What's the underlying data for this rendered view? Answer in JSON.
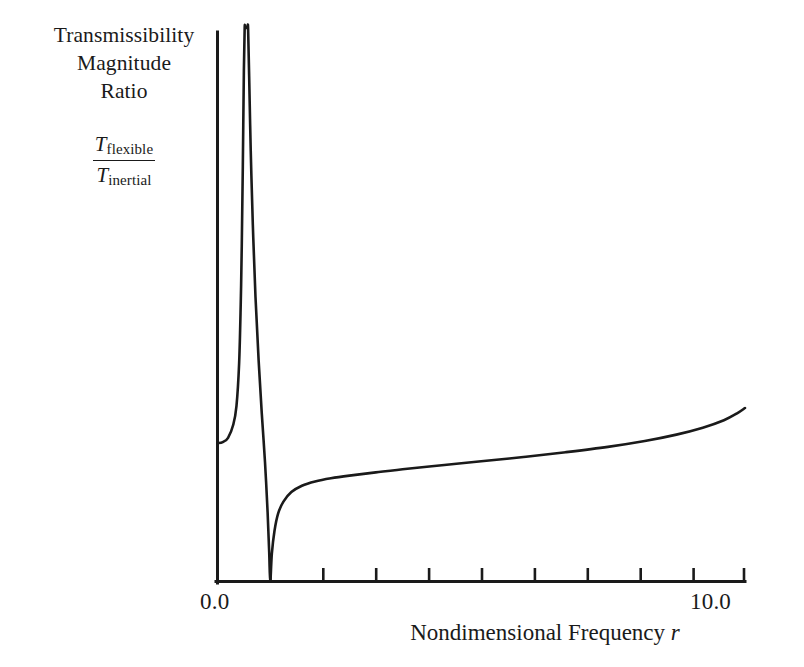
{
  "figure": {
    "background_color": "#ffffff",
    "ink_color": "#1a1a1a"
  },
  "y_axis_caption": {
    "line1": "Transmissibility",
    "line2": "Magnitude",
    "line3": "Ratio"
  },
  "ratio_fraction": {
    "numerator_symbol": "T",
    "numerator_subscript": "flexible",
    "denominator_symbol": "T",
    "denominator_subscript": "inertial"
  },
  "x_axis": {
    "title_text": "Nondimensional Frequency",
    "title_variable": "r",
    "min_label": "0.0",
    "max_label": "10.0"
  },
  "chart_data": {
    "type": "line",
    "title": "",
    "xlabel": "Nondimensional Frequency r",
    "ylabel": "Transmissibility Magnitude Ratio T_flexible / T_inertial",
    "xlim": [
      0.0,
      10.0
    ],
    "ylim": [
      0.0,
      10.4
    ],
    "grid": false,
    "legend": null,
    "xticks": [
      0.0,
      1.0,
      2.0,
      3.0,
      4.0,
      5.0,
      6.0,
      7.0,
      8.0,
      9.0,
      10.0
    ],
    "xticklabels": [
      "0.0",
      "",
      "",
      "",
      "",
      "",
      "",
      "",
      "",
      "",
      "10.0"
    ],
    "yticks": [],
    "yticklabels": [],
    "annotations": [
      {
        "label": "resonance asymptote (curve exits top of frame)",
        "x": 0.55
      },
      {
        "label": "anti-resonance null (curve touches zero)",
        "x": 1.0
      }
    ],
    "series": [
      {
        "name": "T_flexible / T_inertial",
        "color": "#1a1a1a",
        "x": [
          0.0,
          0.1,
          0.2,
          0.3,
          0.36,
          0.41,
          0.44,
          0.46,
          0.48,
          0.5,
          0.515,
          0.525,
          0.535,
          0.545,
          0.555,
          0.565,
          0.58,
          0.6,
          0.63,
          0.67,
          0.72,
          0.78,
          0.84,
          0.9,
          0.95,
          0.98,
          1.0,
          1.03,
          1.08,
          1.15,
          1.25,
          1.4,
          1.6,
          1.85,
          2.15,
          2.5,
          3.0,
          3.6,
          4.3,
          5.0,
          5.8,
          6.6,
          7.4,
          8.1,
          8.7,
          9.2,
          9.6,
          9.85,
          10.0
        ],
        "y": [
          2.6,
          2.62,
          2.7,
          2.95,
          3.3,
          4.1,
          5.2,
          6.3,
          7.8,
          9.6,
          10.4,
          10.4,
          10.4,
          10.4,
          10.4,
          10.4,
          10.4,
          9.5,
          8.1,
          6.7,
          5.35,
          4.15,
          3.15,
          2.25,
          1.3,
          0.55,
          0.0,
          0.52,
          0.95,
          1.28,
          1.5,
          1.68,
          1.8,
          1.88,
          1.94,
          1.99,
          2.05,
          2.12,
          2.19,
          2.26,
          2.34,
          2.43,
          2.53,
          2.64,
          2.76,
          2.89,
          3.03,
          3.16,
          3.26
        ]
      }
    ]
  }
}
